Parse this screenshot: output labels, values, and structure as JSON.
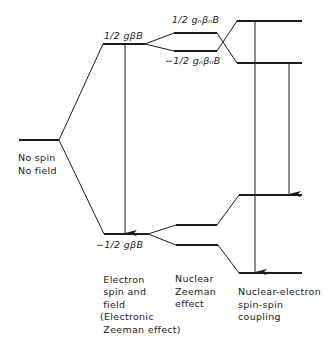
{
  "diagram": {
    "type": "energy-level-diagram",
    "colors": {
      "line": "#1a1a1a",
      "background": "#ffffff"
    },
    "labels": {
      "no_field_line1": "No spin",
      "no_field_line2": "No field",
      "electron_upper": "1/2 gβB",
      "electron_lower": "−1/2 gβB",
      "nuclear_upper": "1/2 gₙβₙB",
      "nuclear_lower": "−1/2 gₙβₙB",
      "col1_caption_1": "Electron",
      "col1_caption_2": "spin and",
      "col1_caption_3": "field",
      "col1_caption_4": "(Electronic",
      "col1_caption_5": "Zeeman effect)",
      "col2_caption_1": "Nuclear",
      "col2_caption_2": "Zeeman",
      "col2_caption_3": "effect",
      "col3_caption_1": "Nuclear-electron",
      "col3_caption_2": "spin-spin",
      "col3_caption_3": "coupling"
    },
    "levels": [
      {
        "id": "no-field",
        "x1": 19,
        "x2": 59,
        "y": 140
      },
      {
        "id": "electron-upper",
        "x1": 103,
        "x2": 145,
        "y": 44
      },
      {
        "id": "electron-lower",
        "x1": 104,
        "x2": 148,
        "y": 234
      },
      {
        "id": "nuclear-upper-a",
        "x1": 174,
        "x2": 217,
        "y": 33
      },
      {
        "id": "nuclear-upper-b",
        "x1": 174,
        "x2": 217,
        "y": 51
      },
      {
        "id": "nuclear-lower-a",
        "x1": 176,
        "x2": 217,
        "y": 225
      },
      {
        "id": "nuclear-lower-b",
        "x1": 176,
        "x2": 218,
        "y": 245
      },
      {
        "id": "coupling-1",
        "x1": 237,
        "x2": 302,
        "y": 21
      },
      {
        "id": "coupling-2",
        "x1": 237,
        "x2": 302,
        "y": 63
      },
      {
        "id": "coupling-3",
        "x1": 239,
        "x2": 302,
        "y": 195
      },
      {
        "id": "coupling-4",
        "x1": 239,
        "x2": 302,
        "y": 273
      }
    ],
    "transitions": [
      {
        "from": "electron-upper",
        "to": "electron-lower",
        "x": 125
      },
      {
        "from": "coupling-1",
        "to": "coupling-4",
        "x": 255
      },
      {
        "from": "coupling-2",
        "to": "coupling-3",
        "x": 289
      }
    ]
  }
}
